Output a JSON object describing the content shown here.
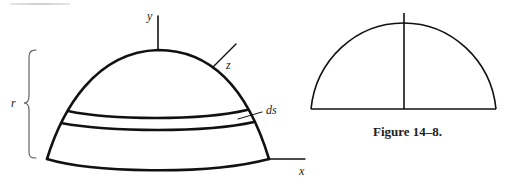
{
  "figure": {
    "caption": "Figure 14–8.",
    "left_diagram": {
      "description": "Hemispherical dome with a thin band of width ds",
      "labels": {
        "y_axis": "y",
        "z_axis": "z",
        "x_axis": "x",
        "radius": "r",
        "band": "ds"
      }
    },
    "right_diagram": {
      "description": "Semicircle with vertical center line"
    },
    "colors": {
      "stroke": "#111111",
      "brace": "#555555",
      "background": "#ffffff"
    }
  }
}
